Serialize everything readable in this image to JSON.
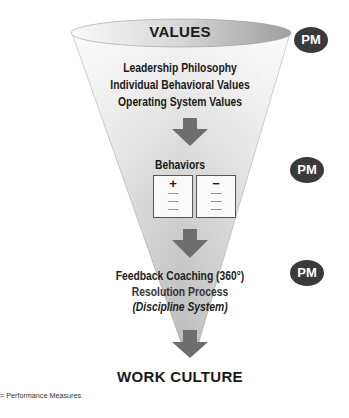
{
  "diagram": {
    "top_label": "VALUES",
    "values_items": [
      "Leadership Philosophy",
      "Individual Behavioral Values",
      "Operating System Values"
    ],
    "behaviors": {
      "title": "Behaviors",
      "positive_sign": "+",
      "negative_sign": "−",
      "positive_lines": [
        "~~~",
        "~~~",
        "~~~"
      ],
      "negative_lines": [
        "~~~",
        "~~~",
        "~~~"
      ]
    },
    "feedback_items": [
      "Feedback Coaching (360°)",
      "Resolution Process",
      "(Discipline System)"
    ],
    "bottom_label": "WORK CULTURE",
    "pm_badges": [
      "PM",
      "PM",
      "PM"
    ],
    "legend": "= Performance Measures",
    "colors": {
      "funnel_light": "#f4f4f4",
      "funnel_dark": "#b5b5b5",
      "arrow": "#6e6e6e",
      "badge": "#3a3a3a"
    }
  }
}
